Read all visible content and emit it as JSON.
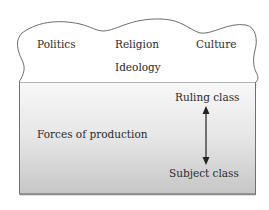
{
  "diagram": {
    "superstructure": {
      "items": [
        "Politics",
        "Religion",
        "Culture",
        "Ideology"
      ]
    },
    "base": {
      "label": "Forces of production",
      "relations": {
        "top": "Ruling class",
        "bottom": "Subject class",
        "arrow": "double-headed vertical arrow"
      }
    },
    "colors": {
      "outline": "#6e6e6e",
      "base_gradient_top": "#f8f8f8",
      "base_gradient_bottom": "#c8c8c8",
      "text": "#2a2a2a"
    }
  }
}
